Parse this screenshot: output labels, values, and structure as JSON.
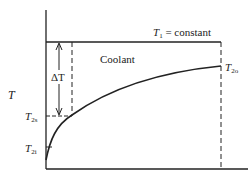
{
  "diagram": {
    "y_axis_label": "T",
    "top_line_label": {
      "var": "T",
      "sub": "1",
      "rest": " = constant"
    },
    "region_label": "Coolant",
    "delta_label": "ΔT",
    "outlet_label": {
      "var": "T",
      "sub": "2o"
    },
    "surface_label": {
      "var": "T",
      "sub": "2s"
    },
    "inlet_label": {
      "var": "T",
      "sub": "2i"
    },
    "colors": {
      "line": "#222222",
      "background": "#ffffff"
    }
  }
}
